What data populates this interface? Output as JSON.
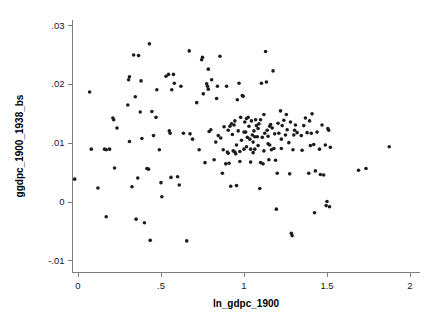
{
  "chart_data": {
    "type": "scatter",
    "title": "",
    "xlabel": "ln_gdpc_1900",
    "ylabel": "ggdpc_1900_1938_bs",
    "xlim": [
      -0.06,
      2.04
    ],
    "ylim": [
      -0.0115,
      0.0305
    ],
    "xticks": [
      0,
      0.5,
      1,
      1.5,
      2
    ],
    "xticklabels": [
      "0",
      ".5",
      "1",
      "1.5",
      "2"
    ],
    "yticks": [
      -0.01,
      0,
      0.01,
      0.02,
      0.03
    ],
    "yticklabels": [
      "-.01",
      "0",
      ".01",
      ".02",
      ".03"
    ],
    "grid": false,
    "legend": null,
    "marker": {
      "shape": "circle",
      "color": "#1c1c1c",
      "size_px": 3.6
    },
    "n_points": 197,
    "points": [
      [
        -0.02,
        0.0038
      ],
      [
        0.07,
        0.0186
      ],
      [
        0.08,
        0.0089
      ],
      [
        0.12,
        0.0023
      ],
      [
        0.16,
        0.0089
      ],
      [
        0.17,
        0.0088
      ],
      [
        0.17,
        -0.0026
      ],
      [
        0.19,
        0.0089
      ],
      [
        0.21,
        0.0142
      ],
      [
        0.215,
        0.0139
      ],
      [
        0.22,
        0.0057
      ],
      [
        0.235,
        0.0125
      ],
      [
        0.3,
        0.0164
      ],
      [
        0.305,
        0.0207
      ],
      [
        0.31,
        0.0212
      ],
      [
        0.31,
        0.0102
      ],
      [
        0.325,
        0.0025
      ],
      [
        0.335,
        0.0249
      ],
      [
        0.345,
        0.0178
      ],
      [
        0.35,
        -0.003
      ],
      [
        0.36,
        0.004
      ],
      [
        0.365,
        0.0248
      ],
      [
        0.375,
        0.0152
      ],
      [
        0.38,
        0.0205
      ],
      [
        0.385,
        0.0107
      ],
      [
        0.4,
        -0.0036
      ],
      [
        0.415,
        0.0056
      ],
      [
        0.425,
        0.0055
      ],
      [
        0.43,
        0.0268
      ],
      [
        0.435,
        -0.0066
      ],
      [
        0.455,
        0.0112
      ],
      [
        0.47,
        0.0143
      ],
      [
        0.475,
        0.019
      ],
      [
        0.49,
        0.0088
      ],
      [
        0.5,
        0.0032
      ],
      [
        0.505,
        0.0008
      ],
      [
        0.53,
        0.0213
      ],
      [
        0.545,
        0.0216
      ],
      [
        0.55,
        0.012
      ],
      [
        0.555,
        0.0116
      ],
      [
        0.56,
        0.0041
      ],
      [
        0.565,
        0.019
      ],
      [
        0.575,
        0.0216
      ],
      [
        0.58,
        0.0201
      ],
      [
        0.6,
        0.0042
      ],
      [
        0.61,
        0.0028
      ],
      [
        0.635,
        0.0116
      ],
      [
        0.655,
        -0.0067
      ],
      [
        0.67,
        0.0256
      ],
      [
        0.675,
        0.0115
      ],
      [
        0.69,
        0.0106
      ],
      [
        0.715,
        0.0168
      ],
      [
        0.73,
        0.0088
      ],
      [
        0.745,
        0.0241
      ],
      [
        0.75,
        0.0245
      ],
      [
        0.755,
        0.0183
      ],
      [
        0.765,
        0.0066
      ],
      [
        0.775,
        0.02
      ],
      [
        0.78,
        0.0196
      ],
      [
        0.785,
        0.0225
      ],
      [
        0.785,
        0.0191
      ],
      [
        0.79,
        0.0119
      ],
      [
        0.8,
        0.0122
      ],
      [
        0.805,
        0.0207
      ],
      [
        0.82,
        0.0071
      ],
      [
        0.83,
        0.0101
      ],
      [
        0.835,
        0.0175
      ],
      [
        0.845,
        0.0112
      ],
      [
        0.855,
        0.0247
      ],
      [
        0.86,
        0.0108
      ],
      [
        0.87,
        0.0048
      ],
      [
        0.875,
        0.0088
      ],
      [
        0.89,
        0.0064
      ],
      [
        0.895,
        0.0196
      ],
      [
        0.9,
        0.0084
      ],
      [
        0.905,
        0.0082
      ],
      [
        0.91,
        0.0065
      ],
      [
        0.915,
        0.0128
      ],
      [
        0.92,
        0.0026
      ],
      [
        0.925,
        0.0132
      ],
      [
        0.935,
        0.0086
      ],
      [
        0.94,
        0.013
      ],
      [
        0.945,
        0.0084
      ],
      [
        0.95,
        0.0081
      ],
      [
        0.955,
        0.0027
      ],
      [
        0.96,
        0.0173
      ],
      [
        0.965,
        0.012
      ],
      [
        0.97,
        0.0201
      ],
      [
        0.975,
        0.0085
      ],
      [
        0.98,
        0.0143
      ],
      [
        0.985,
        0.0104
      ],
      [
        0.99,
        0.018
      ],
      [
        0.995,
        0.0179
      ],
      [
        1.0,
        0.0089
      ],
      [
        1.005,
        0.0135
      ],
      [
        1.01,
        0.0118
      ],
      [
        1.015,
        0.0141
      ],
      [
        1.02,
        0.0109
      ],
      [
        1.025,
        0.0143
      ],
      [
        1.03,
        0.0128
      ],
      [
        1.035,
        0.0106
      ],
      [
        1.04,
        0.0089
      ],
      [
        1.045,
        0.0137
      ],
      [
        1.05,
        0.0113
      ],
      [
        1.055,
        0.0083
      ],
      [
        1.06,
        0.012
      ],
      [
        1.065,
        0.011
      ],
      [
        1.07,
        0.0139
      ],
      [
        1.075,
        0.0129
      ],
      [
        1.08,
        0.011
      ],
      [
        1.085,
        0.0095
      ],
      [
        1.09,
        0.0132
      ],
      [
        1.095,
        0.0022
      ],
      [
        1.1,
        0.0066
      ],
      [
        1.105,
        0.0201
      ],
      [
        1.11,
        0.0109
      ],
      [
        1.115,
        0.0064
      ],
      [
        1.12,
        0.0086
      ],
      [
        1.125,
        0.0116
      ],
      [
        1.13,
        0.0255
      ],
      [
        1.135,
        0.0203
      ],
      [
        1.14,
        0.0121
      ],
      [
        1.145,
        0.0111
      ],
      [
        1.15,
        0.0071
      ],
      [
        1.155,
        0.0096
      ],
      [
        1.16,
        0.0131
      ],
      [
        1.165,
        0.0088
      ],
      [
        1.17,
        0.0125
      ],
      [
        1.175,
        0.0222
      ],
      [
        1.18,
        0.009
      ],
      [
        1.185,
        0.0115
      ],
      [
        1.19,
        0.007
      ],
      [
        1.195,
        -0.0013
      ],
      [
        1.2,
        0.0048
      ],
      [
        1.205,
        0.0133
      ],
      [
        1.21,
        0.0116
      ],
      [
        1.22,
        0.0154
      ],
      [
        1.225,
        0.0106
      ],
      [
        1.23,
        0.0129
      ],
      [
        1.24,
        0.0138
      ],
      [
        1.25,
        0.0113
      ],
      [
        1.255,
        0.0148
      ],
      [
        1.26,
        0.0122
      ],
      [
        1.27,
        0.01
      ],
      [
        1.275,
        0.0047
      ],
      [
        1.28,
        0.0135
      ],
      [
        1.285,
        -0.0054
      ],
      [
        1.29,
        -0.0058
      ],
      [
        1.295,
        0.0088
      ],
      [
        1.3,
        0.0113
      ],
      [
        1.31,
        0.013
      ],
      [
        1.32,
        0.0117
      ],
      [
        1.35,
        0.0087
      ],
      [
        1.36,
        0.0129
      ],
      [
        1.37,
        0.0142
      ],
      [
        1.38,
        0.0117
      ],
      [
        1.39,
        0.0048
      ],
      [
        1.395,
        0.0137
      ],
      [
        1.4,
        0.0095
      ],
      [
        1.405,
        0.0116
      ],
      [
        1.41,
        0.0149
      ],
      [
        1.42,
        0.0097
      ],
      [
        1.425,
        -0.0019
      ],
      [
        1.43,
        0.0052
      ],
      [
        1.44,
        0.0118
      ],
      [
        1.455,
        0.0089
      ],
      [
        1.46,
        0.0046
      ],
      [
        1.47,
        0.013
      ],
      [
        1.48,
        0.0045
      ],
      [
        1.49,
        0.0096
      ],
      [
        1.495,
        -0.0007
      ],
      [
        1.5,
        0.0
      ],
      [
        1.505,
        0.0124
      ],
      [
        1.51,
        0.0121
      ],
      [
        1.515,
        -0.0009
      ],
      [
        1.52,
        0.0092
      ],
      [
        1.69,
        0.0053
      ],
      [
        1.735,
        0.0056
      ],
      [
        1.875,
        0.0093
      ],
      [
        0.445,
        0.0153
      ],
      [
        0.62,
        0.0196
      ],
      [
        0.84,
        0.0196
      ],
      [
        1.12,
        0.0148
      ],
      [
        0.93,
        0.0114
      ],
      [
        1.065,
        0.0089
      ],
      [
        0.975,
        0.0068
      ],
      [
        1.04,
        0.0067
      ],
      [
        1.145,
        0.0098
      ],
      [
        1.225,
        0.009
      ],
      [
        0.88,
        0.0127
      ],
      [
        0.955,
        0.0096
      ],
      [
        1.015,
        0.0093
      ],
      [
        1.085,
        0.0124
      ],
      [
        1.1,
        0.0139
      ],
      [
        1.155,
        0.0128
      ],
      [
        1.305,
        0.0121
      ],
      [
        1.345,
        0.0112
      ],
      [
        0.905,
        0.0121
      ],
      [
        0.945,
        0.0137
      ],
      [
        1.0,
        0.0118
      ],
      [
        1.055,
        0.0101
      ]
    ]
  },
  "axes": {
    "x_tick_labels": [
      "0",
      ".5",
      "1",
      "1.5",
      "2"
    ],
    "y_tick_labels": [
      ".03",
      ".02",
      ".01",
      "0",
      "-.01"
    ],
    "x_axis_title": "ln_gdpc_1900",
    "y_axis_title": "ggdpc_1900_1938_bs"
  },
  "colors": {
    "marker": "#1c1c1c",
    "axis": "#7d7d7d",
    "text": "#111111",
    "background": "#ffffff"
  }
}
